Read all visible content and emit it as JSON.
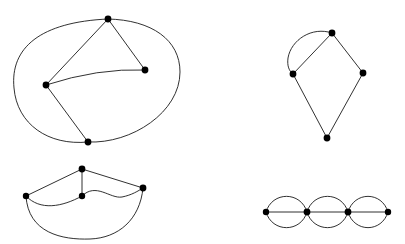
{
  "figure": {
    "background_color": "#ffffff",
    "edge_color": "#1a1a1a",
    "vertex_color": "#000000",
    "edge_width": 0.9,
    "vertex_radius": 3.2,
    "width": 405,
    "height": 244,
    "panels": [
      {
        "name": "top-left-graph",
        "label": "Quadrilateral with outer cycle and inner chords",
        "vertices": [
          {
            "id": "tl-top",
            "x": 108,
            "y": 19
          },
          {
            "id": "tl-left",
            "x": 46,
            "y": 85
          },
          {
            "id": "tl-right",
            "x": 145,
            "y": 70
          },
          {
            "id": "tl-bottom",
            "x": 88,
            "y": 142
          }
        ],
        "edges": [
          {
            "from": "tl-top",
            "to": "tl-left",
            "type": "straight"
          },
          {
            "from": "tl-top",
            "to": "tl-right",
            "type": "straight"
          },
          {
            "from": "tl-left",
            "to": "tl-right",
            "type": "curve",
            "cx": 96,
            "cy": 72
          },
          {
            "from": "tl-left",
            "to": "tl-bottom",
            "type": "straight"
          },
          {
            "from": "tl-top",
            "to": "tl-bottom",
            "type": "outer-loop-left",
            "c1x": 10,
            "c1y": 30,
            "c2x": 22,
            "c2y": 140
          },
          {
            "from": "tl-top",
            "to": "tl-bottom",
            "type": "outer-loop-right",
            "c1x": 196,
            "c1y": 32,
            "c2x": 150,
            "c2y": 160
          }
        ]
      },
      {
        "name": "bottom-left-graph",
        "label": "Fan with wavy chord and outer arc",
        "vertices": [
          {
            "id": "bl-left",
            "x": 26,
            "y": 196
          },
          {
            "id": "bl-top",
            "x": 82,
            "y": 169
          },
          {
            "id": "bl-mid",
            "x": 82,
            "y": 196
          },
          {
            "id": "bl-right",
            "x": 143,
            "y": 188
          }
        ],
        "edges": [
          {
            "from": "bl-left",
            "to": "bl-top",
            "type": "straight"
          },
          {
            "from": "bl-top",
            "to": "bl-right",
            "type": "straight"
          },
          {
            "from": "bl-top",
            "to": "bl-mid",
            "type": "straight"
          },
          {
            "from": "bl-left",
            "to": "bl-mid",
            "type": "curve-down",
            "c1x": 45,
            "c1y": 210,
            "c2x": 65,
            "c2y": 205
          },
          {
            "from": "bl-mid",
            "to": "bl-right",
            "type": "wave",
            "c1x": 100,
            "c1y": 185,
            "c2x": 122,
            "c2y": 196
          },
          {
            "from": "bl-left",
            "to": "bl-right",
            "type": "outer-arc",
            "c1x": 36,
            "c1y": 245,
            "c2x": 140,
            "c2y": 232
          }
        ]
      },
      {
        "name": "top-right-graph",
        "label": "Kite with doubled top-left edge",
        "vertices": [
          {
            "id": "tr-top",
            "x": 332,
            "y": 33
          },
          {
            "id": "tr-left",
            "x": 293,
            "y": 74
          },
          {
            "id": "tr-right",
            "x": 363,
            "y": 73
          },
          {
            "id": "tr-bottom",
            "x": 327,
            "y": 138
          }
        ],
        "edges": [
          {
            "from": "tr-top",
            "to": "tr-left",
            "type": "straight"
          },
          {
            "from": "tr-top",
            "to": "tr-left",
            "type": "arc",
            "c1x": 313,
            "c1y": 28,
            "c2x": 288,
            "c2y": 52
          },
          {
            "from": "tr-top",
            "to": "tr-right",
            "type": "straight"
          },
          {
            "from": "tr-left",
            "to": "tr-bottom",
            "type": "straight"
          },
          {
            "from": "tr-right",
            "to": "tr-bottom",
            "type": "straight"
          }
        ]
      },
      {
        "name": "bottom-right-graph",
        "label": "Chain of three multi-edge lenses",
        "vertices": [
          {
            "id": "br-v1",
            "x": 266,
            "y": 212
          },
          {
            "id": "br-v2",
            "x": 307,
            "y": 212
          },
          {
            "id": "br-v3",
            "x": 348,
            "y": 212
          },
          {
            "id": "br-v4",
            "x": 388,
            "y": 212
          }
        ],
        "edges": [
          {
            "from": "br-v1",
            "to": "br-v2",
            "type": "lens-top",
            "bulge": -17
          },
          {
            "from": "br-v1",
            "to": "br-v2",
            "type": "lens-middle",
            "bulge": 0
          },
          {
            "from": "br-v1",
            "to": "br-v2",
            "type": "lens-bottom",
            "bulge": 17
          },
          {
            "from": "br-v2",
            "to": "br-v3",
            "type": "lens-top",
            "bulge": -17
          },
          {
            "from": "br-v2",
            "to": "br-v3",
            "type": "lens-middle",
            "bulge": 0
          },
          {
            "from": "br-v2",
            "to": "br-v3",
            "type": "lens-bottom",
            "bulge": 17
          },
          {
            "from": "br-v3",
            "to": "br-v4",
            "type": "lens-top",
            "bulge": -17
          },
          {
            "from": "br-v3",
            "to": "br-v4",
            "type": "lens-middle",
            "bulge": 0
          },
          {
            "from": "br-v3",
            "to": "br-v4",
            "type": "lens-bottom",
            "bulge": 17
          }
        ]
      }
    ]
  }
}
